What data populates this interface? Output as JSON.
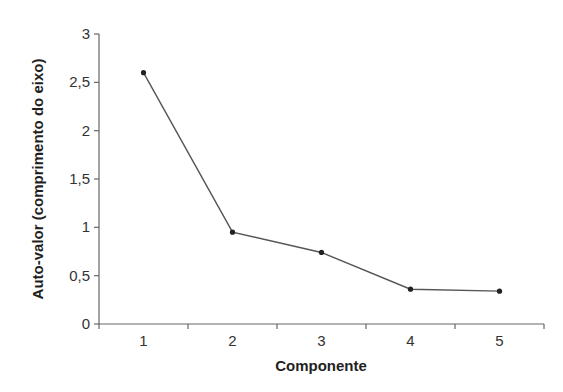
{
  "chart_data": {
    "type": "line",
    "title": "",
    "xlabel": "Componente",
    "ylabel": "Auto-valor (comprimento do eixo)",
    "categories": [
      "1",
      "2",
      "3",
      "4",
      "5"
    ],
    "values": [
      2.6,
      0.95,
      0.74,
      0.36,
      0.34
    ],
    "ylim": [
      0,
      3
    ],
    "yticks": [
      "0",
      "0,5",
      "1",
      "1,5",
      "2",
      "2,5",
      "3"
    ],
    "ytick_values": [
      0,
      0.5,
      1,
      1.5,
      2,
      2.5,
      3
    ],
    "grid": false,
    "legend": null,
    "colors": {
      "line": "#555555",
      "marker": "#222222",
      "axis": "#666666"
    }
  }
}
